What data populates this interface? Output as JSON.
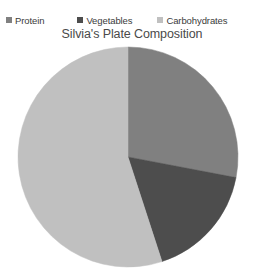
{
  "chart_data": {
    "type": "pie",
    "title": "Silvia's Plate Composition",
    "categories": [
      "Protein",
      "Vegetables",
      "Carbohydrates"
    ],
    "values": [
      28,
      17,
      55
    ],
    "value_unit": "percent",
    "colors": [
      "#808080",
      "#4d4d4d",
      "#c0c0c0"
    ],
    "legend_position": "top",
    "grid": false,
    "xlabel": "",
    "ylabel": "",
    "start_angle_deg": 0,
    "direction": "clockwise",
    "center": {
      "cx": 128,
      "cy": 157,
      "r": 110
    },
    "slices": [
      {
        "label": "Protein",
        "value": 28,
        "color": "#808080",
        "start_deg": 0,
        "end_deg": 100.8
      },
      {
        "label": "Vegetables",
        "value": 17,
        "color": "#4d4d4d",
        "start_deg": 100.8,
        "end_deg": 162.0
      },
      {
        "label": "Carbohydrates",
        "value": 55,
        "color": "#c0c0c0",
        "start_deg": 162.0,
        "end_deg": 360.0
      }
    ]
  },
  "legend": {
    "items": [
      {
        "label": "Protein",
        "marker": "legend-swatch-protein",
        "color": "#808080"
      },
      {
        "label": "Vegetables",
        "marker": "legend-swatch-vegetables",
        "color": "#4d4d4d"
      },
      {
        "label": "Carbohydrates",
        "marker": "legend-swatch-carbohydrates",
        "color": "#c0c0c0"
      }
    ]
  },
  "title": "Silvia's Plate Composition"
}
